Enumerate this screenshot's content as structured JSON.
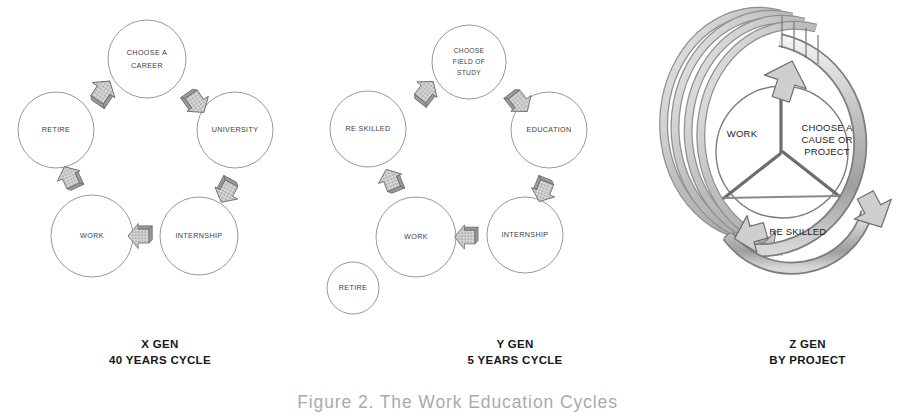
{
  "figure": {
    "caption": "Figure 2. The Work Education Cycles",
    "background_color": "#ffffff",
    "circle_stroke_color": "#8c8c8c",
    "arrow_fill_color": "#c9c9c9",
    "arrow_stroke_color": "#6e6e6e",
    "label_color": "#3d3d3d"
  },
  "panels": [
    {
      "id": "xgen",
      "caption_line1": "X GEN",
      "caption_line2": "40 YEARS CYCLE",
      "nodes": [
        {
          "id": "choose-a-career",
          "lines": [
            "CHOOSE A",
            "CAREER"
          ]
        },
        {
          "id": "university",
          "lines": [
            "UNIVERSITY"
          ]
        },
        {
          "id": "internship",
          "lines": [
            "INTERNSHIP"
          ]
        },
        {
          "id": "work",
          "lines": [
            "WORK"
          ]
        },
        {
          "id": "retire",
          "lines": [
            "RETIRE"
          ]
        }
      ],
      "arrows": [
        {
          "id": "career-to-university"
        },
        {
          "id": "university-to-internship"
        },
        {
          "id": "internship-to-work"
        },
        {
          "id": "work-to-retire"
        },
        {
          "id": "retire-to-career"
        }
      ]
    },
    {
      "id": "ygen",
      "caption_line1": "Y GEN",
      "caption_line2": "5 YEARS CYCLE",
      "nodes": [
        {
          "id": "choose-field-of-study",
          "lines": [
            "CHOOSE",
            "FIELD OF",
            "STUDY"
          ]
        },
        {
          "id": "education",
          "lines": [
            "EDUCATION"
          ]
        },
        {
          "id": "internship",
          "lines": [
            "INTERNSHIP"
          ]
        },
        {
          "id": "work",
          "lines": [
            "WORK"
          ]
        },
        {
          "id": "re-skilled",
          "lines": [
            "RE SKILLED"
          ]
        },
        {
          "id": "retire",
          "lines": [
            "RETIRE"
          ]
        }
      ],
      "arrows": [
        {
          "id": "study-to-education"
        },
        {
          "id": "education-to-internship"
        },
        {
          "id": "internship-to-work"
        },
        {
          "id": "work-to-re-skilled"
        },
        {
          "id": "re-skilled-to-study"
        }
      ]
    },
    {
      "id": "zgen",
      "caption_line1": "Z GEN",
      "caption_line2": "BY PROJECT",
      "segments": [
        {
          "id": "work",
          "lines": [
            "WORK"
          ]
        },
        {
          "id": "choose-a-cause-or-project",
          "lines": [
            "CHOOSE A",
            "CAUSE OR",
            "PROJECT"
          ]
        },
        {
          "id": "up-and-re-skilled",
          "lines": [
            "UP & RE SKILLED"
          ]
        }
      ],
      "spiral_arc_count": 5
    }
  ]
}
